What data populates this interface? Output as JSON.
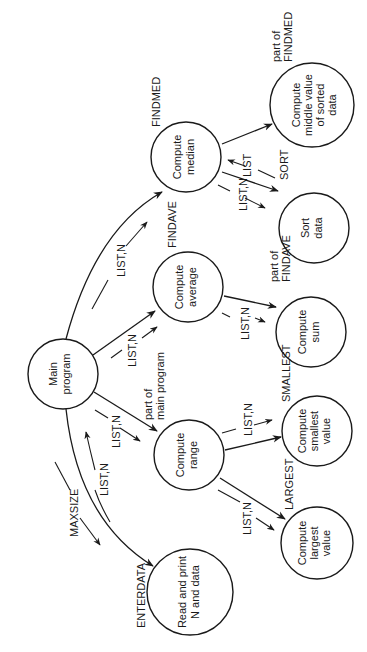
{
  "diagram": {
    "orientation": "rotated-90-ccw",
    "nodes": {
      "main": {
        "lines": [
          "Main",
          "program"
        ]
      },
      "range": {
        "lines": [
          "Compute",
          "range"
        ],
        "module": "part of",
        "module2": "main program"
      },
      "average": {
        "lines": [
          "Compute",
          "average"
        ],
        "module": "FINDAVE"
      },
      "median": {
        "lines": [
          "Compute",
          "median"
        ],
        "module": "FINDMED"
      },
      "middle": {
        "lines": [
          "Compute",
          "middle value",
          "of sorted",
          "data"
        ],
        "module": "part of",
        "module2": "FINDMED"
      },
      "sort": {
        "lines": [
          "Sort",
          "data"
        ],
        "module": "SORT"
      },
      "sum": {
        "lines": [
          "Compute",
          "sum"
        ],
        "module": "part of",
        "module2": "FINDAVE"
      },
      "smallest": {
        "lines": [
          "Compute",
          "smallest",
          "value"
        ],
        "module": "SMALLEST"
      },
      "largest": {
        "lines": [
          "Compute",
          "largest",
          "value"
        ],
        "module": "LARGEST"
      },
      "readprint": {
        "lines": [
          "Read and print",
          "N and data"
        ],
        "module": "ENTERDATA"
      }
    },
    "flows": {
      "main_to_median": "LIST,N",
      "main_to_average": "LIST,N",
      "main_to_range": "LIST,N",
      "readprint_to_main": "LIST,N",
      "main_to_readprint": "MAXSIZE",
      "median_to_sort": "LIST,N",
      "sort_to_median": "LIST",
      "average_to_sum": "LIST,N",
      "range_to_smallest": "LIST,N",
      "range_to_largest": "LIST,N"
    }
  }
}
